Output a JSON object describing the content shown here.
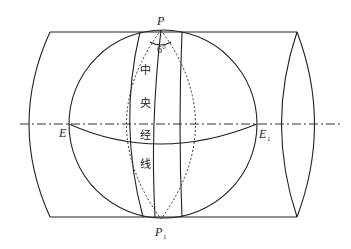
{
  "figure": {
    "type": "transverse-cylindrical-projection-diagram",
    "labels": {
      "north_pole": "P",
      "south_pole": "P",
      "south_pole_subscript": "1",
      "equator_west": "E",
      "equator_east": "E",
      "equator_east_subscript": "1",
      "zone_width": "6°",
      "central_meridian_chars": [
        "中",
        "央",
        "经",
        "线"
      ]
    },
    "colors": {
      "stroke": "#222222",
      "background": "#ffffff"
    }
  }
}
